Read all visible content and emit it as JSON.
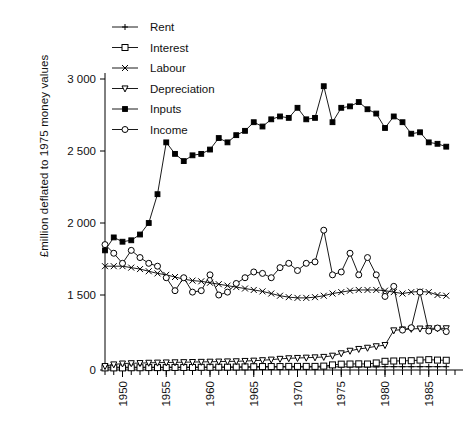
{
  "chart_data": {
    "type": "line",
    "title": "",
    "xlabel": "",
    "ylabel": "£million deflated to 1975 money values",
    "xlim": [
      1948,
      1988
    ],
    "ylim": [
      0,
      3050
    ],
    "y_break": {
      "from": 150,
      "to": 1450,
      "note": "axis broken between 0 and 1 500"
    },
    "grid": false,
    "legend_position": "top-left",
    "y_ticks": [
      0,
      1500,
      2000,
      2500,
      3000
    ],
    "y_tick_labels": [
      "0",
      "1 500",
      "2 000",
      "2 500",
      "3 000"
    ],
    "x_ticks": [
      1950,
      1955,
      1960,
      1965,
      1970,
      1975,
      1980,
      1985
    ],
    "x_tick_labels": [
      "1950",
      "1955",
      "1960",
      "1965",
      "1970",
      "1975",
      "1980",
      "1985"
    ],
    "x_minor_tick_interval": 1,
    "x": [
      1948,
      1949,
      1950,
      1951,
      1952,
      1953,
      1954,
      1955,
      1956,
      1957,
      1958,
      1959,
      1960,
      1961,
      1962,
      1963,
      1964,
      1965,
      1966,
      1967,
      1968,
      1969,
      1970,
      1971,
      1972,
      1973,
      1974,
      1975,
      1976,
      1977,
      1978,
      1979,
      1980,
      1981,
      1982,
      1983,
      1984,
      1985,
      1986,
      1987
    ],
    "series": [
      {
        "name": "Rent",
        "marker": "plus",
        "fill": "none",
        "color": "#000000",
        "values": [
          95,
          95,
          95,
          95,
          95,
          95,
          95,
          95,
          95,
          95,
          95,
          95,
          95,
          95,
          95,
          95,
          95,
          95,
          100,
          100,
          100,
          100,
          100,
          100,
          100,
          100,
          105,
          105,
          105,
          105,
          105,
          105,
          110,
          110,
          110,
          110,
          110,
          110,
          110,
          110
        ]
      },
      {
        "name": "Interest",
        "marker": "square-open",
        "fill": "none",
        "color": "#000000",
        "values": [
          70,
          70,
          70,
          75,
          75,
          80,
          80,
          80,
          85,
          85,
          85,
          90,
          90,
          95,
          95,
          100,
          105,
          110,
          115,
          115,
          115,
          120,
          120,
          120,
          120,
          130,
          170,
          195,
          200,
          205,
          200,
          235,
          290,
          300,
          305,
          310,
          330,
          345,
          330,
          325
        ]
      },
      {
        "name": "Labour",
        "marker": "x",
        "fill": "none",
        "color": "#000000",
        "values": [
          1700,
          1700,
          1700,
          1690,
          1680,
          1665,
          1650,
          1640,
          1625,
          1610,
          1600,
          1595,
          1585,
          1575,
          1565,
          1555,
          1545,
          1535,
          1525,
          1510,
          1495,
          1485,
          1480,
          1480,
          1485,
          1495,
          1510,
          1520,
          1530,
          1535,
          1535,
          1535,
          1530,
          1520,
          1510,
          1520,
          1525,
          1520,
          1500,
          1495
        ]
      },
      {
        "name": "Depreciation",
        "marker": "triangle-down-open",
        "fill": "none",
        "color": "#000000",
        "values": [
          130,
          185,
          215,
          225,
          230,
          240,
          245,
          250,
          255,
          260,
          265,
          270,
          275,
          280,
          285,
          290,
          300,
          310,
          325,
          345,
          370,
          390,
          400,
          410,
          420,
          435,
          475,
          555,
          640,
          700,
          740,
          790,
          830,
          1320,
          1350,
          1370,
          1380,
          1390,
          1390,
          1390
        ]
      },
      {
        "name": "Inputs",
        "marker": "square-filled",
        "fill": "solid",
        "color": "#000000",
        "values": [
          1810,
          1900,
          1870,
          1880,
          1920,
          2000,
          2200,
          2560,
          2480,
          2430,
          2470,
          2480,
          2510,
          2590,
          2560,
          2610,
          2640,
          2700,
          2670,
          2720,
          2740,
          2730,
          2800,
          2720,
          2730,
          2950,
          2700,
          2800,
          2810,
          2840,
          2790,
          2760,
          2660,
          2740,
          2700,
          2620,
          2630,
          2560,
          2550,
          2530
        ]
      },
      {
        "name": "Income",
        "marker": "circle-open",
        "fill": "none",
        "color": "#000000",
        "values": [
          1850,
          1790,
          1720,
          1810,
          1760,
          1720,
          1700,
          1620,
          1530,
          1620,
          1520,
          1530,
          1640,
          1500,
          1520,
          1580,
          1620,
          1660,
          1650,
          1620,
          1690,
          1720,
          1670,
          1720,
          1730,
          1950,
          1640,
          1660,
          1790,
          1640,
          1760,
          1640,
          1490,
          1560,
          1330,
          1410,
          1520,
          1300,
          1400,
          1280
        ]
      }
    ]
  },
  "legend": {
    "entries": [
      {
        "label": "Rent"
      },
      {
        "label": "Interest"
      },
      {
        "label": "Labour"
      },
      {
        "label": "Depreciation"
      },
      {
        "label": "Inputs"
      },
      {
        "label": "Income"
      }
    ]
  }
}
